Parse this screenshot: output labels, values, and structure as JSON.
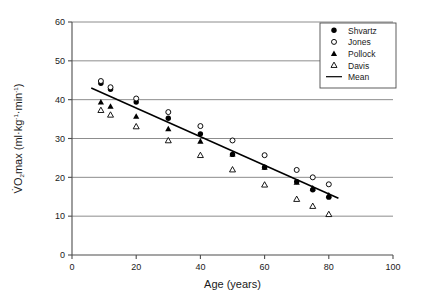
{
  "chart_data": {
    "type": "scatter",
    "title": "",
    "xlabel": "Age (years)",
    "ylabel": "VO2max (ml·kg⁻¹·min⁻¹)",
    "ylabel_parts": {
      "lead": "V",
      "dot_over": "̇",
      "o": "O",
      "subscript": "2",
      "rest": "max (ml·kg",
      "exp1_minus": "-1",
      "mid": "·min",
      "exp2_minus": "-1",
      "close": ")"
    },
    "xlim": [
      0,
      100
    ],
    "ylim": [
      0,
      60
    ],
    "xticks": [
      0,
      20,
      40,
      60,
      80,
      100
    ],
    "yticks": [
      0,
      10,
      20,
      30,
      40,
      50,
      60
    ],
    "xtick_labels": [
      "0",
      "20",
      "40",
      "60",
      "80",
      "100"
    ],
    "ytick_labels": [
      "0",
      "10",
      "20",
      "30",
      "40",
      "50",
      "60"
    ],
    "grid": "horizontal",
    "legend_position": "top-right",
    "series": [
      {
        "name": "Shvartz",
        "marker": "filled-circle",
        "color": "#000000",
        "points": [
          {
            "x": 9,
            "y": 44.2
          },
          {
            "x": 12,
            "y": 42.7
          },
          {
            "x": 20,
            "y": 39.4
          },
          {
            "x": 30,
            "y": 35.2
          },
          {
            "x": 40,
            "y": 31.2
          },
          {
            "x": 50,
            "y": 25.9
          },
          {
            "x": 60,
            "y": 22.6
          },
          {
            "x": 70,
            "y": 18.9
          },
          {
            "x": 75,
            "y": 16.8
          },
          {
            "x": 80,
            "y": 14.9
          }
        ]
      },
      {
        "name": "Jones",
        "marker": "open-circle",
        "color": "#000000",
        "points": [
          {
            "x": 9,
            "y": 44.8
          },
          {
            "x": 12,
            "y": 43.2
          },
          {
            "x": 20,
            "y": 40.3
          },
          {
            "x": 30,
            "y": 36.8
          },
          {
            "x": 40,
            "y": 33.2
          },
          {
            "x": 50,
            "y": 29.5
          },
          {
            "x": 60,
            "y": 25.7
          },
          {
            "x": 70,
            "y": 21.9
          },
          {
            "x": 75,
            "y": 20.0
          },
          {
            "x": 80,
            "y": 18.2
          }
        ]
      },
      {
        "name": "Pollock",
        "marker": "filled-triangle",
        "color": "#000000",
        "points": [
          {
            "x": 9,
            "y": 39.4
          },
          {
            "x": 12,
            "y": 38.3
          },
          {
            "x": 20,
            "y": 35.7
          },
          {
            "x": 30,
            "y": 32.5
          },
          {
            "x": 40,
            "y": 29.3
          },
          {
            "x": 50,
            "y": 26.0
          },
          {
            "x": 60,
            "y": 22.6
          },
          {
            "x": 70,
            "y": 18.7
          },
          {
            "x": 75,
            "y": 17.2
          },
          {
            "x": 80,
            "y": 15.4
          }
        ]
      },
      {
        "name": "Davis",
        "marker": "open-triangle",
        "color": "#000000",
        "points": [
          {
            "x": 9,
            "y": 37.3
          },
          {
            "x": 12,
            "y": 36.1
          },
          {
            "x": 20,
            "y": 33.1
          },
          {
            "x": 30,
            "y": 29.5
          },
          {
            "x": 40,
            "y": 25.7
          },
          {
            "x": 50,
            "y": 22.0
          },
          {
            "x": 60,
            "y": 18.1
          },
          {
            "x": 70,
            "y": 14.4
          },
          {
            "x": 75,
            "y": 12.6
          },
          {
            "x": 80,
            "y": 10.5
          }
        ]
      }
    ],
    "trendline": {
      "name": "Mean",
      "style": "solid",
      "color": "#000000",
      "x_start": 6,
      "y_start": 43.0,
      "x_end": 83,
      "y_end": 14.6
    },
    "legend": {
      "entries": [
        {
          "label": "Shvartz",
          "marker": "filled-circle"
        },
        {
          "label": "Jones",
          "marker": "open-circle"
        },
        {
          "label": "Pollock",
          "marker": "filled-triangle"
        },
        {
          "label": "Davis",
          "marker": "open-triangle"
        },
        {
          "label": "Mean",
          "marker": "line"
        }
      ]
    }
  }
}
